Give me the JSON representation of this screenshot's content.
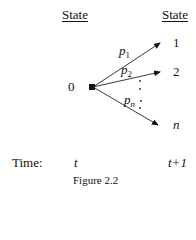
{
  "diagram": {
    "header_left": "State",
    "header_right": "State",
    "origin_state": "0",
    "target_states": [
      {
        "label": "1",
        "probability_base": "p",
        "probability_sub": "1"
      },
      {
        "label": "2",
        "probability_base": "p",
        "probability_sub": "2"
      },
      {
        "label": "n",
        "probability_base": "p",
        "probability_sub": "n"
      }
    ],
    "time_label": "Time:",
    "time_start": "t",
    "time_end": "t+1",
    "caption": "Figure 2.2"
  }
}
